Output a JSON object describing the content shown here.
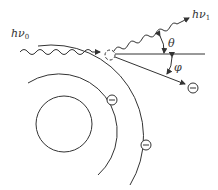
{
  "diagram": {
    "labels": {
      "incident_photon": "hν",
      "incident_sub": "0",
      "scattered_photon": "hν",
      "scattered_sub": "1",
      "photon_angle": "θ",
      "electron_angle": "φ",
      "electron_symbol": "−"
    },
    "elements": {
      "nucleus": "inner circle",
      "orbits": [
        "inner orbit arc",
        "outer orbit arc"
      ],
      "vacancy": "dashed circle (ejected electron site)",
      "electrons": [
        "orbit-1 electron",
        "orbit-2 electron",
        "recoil electron"
      ]
    },
    "colors": {
      "stroke": "#333333",
      "background": "#ffffff"
    }
  }
}
